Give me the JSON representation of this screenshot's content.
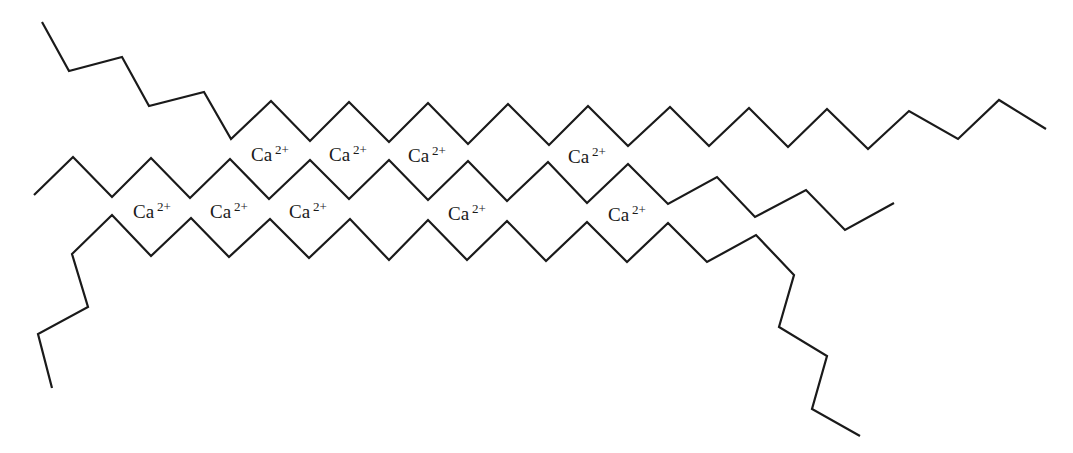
{
  "diagram": {
    "stroke_color": "#1a1a1a",
    "background": "#ffffff",
    "chains": [
      {
        "id": "top-chain",
        "points": "42,22 69,71 122,57 149,106 204,92 231,139 271,101 310,141 349,102 389,142 428,103 468,144 508,104 549,145 588,106 628,146 670,107 709,146 749,108 788,147 827,109 868,149 909,111 958,139 999,100 1046,129"
      },
      {
        "id": "middle-chain",
        "points": "34,195 73,157 112,197 151,158 190,198 230,159 269,199 310,160 349,199 389,160 428,200 468,161 507,201 548,162 587,203 628,164 668,204 717,177 755,217 806,190 845,230 894,203"
      },
      {
        "id": "bottom-chain",
        "points": "52,388 38,334 88,307 72,254 112,215 151,256 191,218 229,257 270,219 309,258 350,219 389,260 428,220 467,260 507,221 546,261 587,222 627,262 668,223 707,262 756,235 794,275 779,327 827,356 812,409 860,436"
      }
    ],
    "ions": [
      {
        "symbol": "Ca",
        "charge": "2+",
        "x": 251,
        "y": 145
      },
      {
        "symbol": "Ca",
        "charge": "2+",
        "x": 329,
        "y": 145
      },
      {
        "symbol": "Ca",
        "charge": "2+",
        "x": 408,
        "y": 146
      },
      {
        "symbol": "Ca",
        "charge": "2+",
        "x": 568,
        "y": 147
      },
      {
        "symbol": "Ca",
        "charge": "2+",
        "x": 133,
        "y": 202
      },
      {
        "symbol": "Ca",
        "charge": "2+",
        "x": 210,
        "y": 202
      },
      {
        "symbol": "Ca",
        "charge": "2+",
        "x": 289,
        "y": 202
      },
      {
        "symbol": "Ca",
        "charge": "2+",
        "x": 448,
        "y": 204
      },
      {
        "symbol": "Ca",
        "charge": "2+",
        "x": 608,
        "y": 205
      }
    ]
  }
}
